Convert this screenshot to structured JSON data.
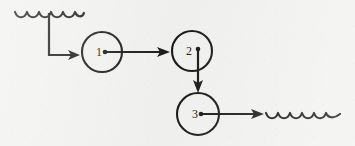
{
  "figure": {
    "type": "flow-diagram",
    "style": "hand-drawn scanned line art",
    "background_color": "#f2f2f0",
    "ink_color": "#1a1a1a",
    "width": 355,
    "height": 146
  },
  "nodes": [
    {
      "id": "node-1",
      "label": "1",
      "cx": 102,
      "cy": 52,
      "r": 20
    },
    {
      "id": "node-2",
      "label": "2",
      "cx": 192,
      "cy": 51,
      "r": 20
    },
    {
      "id": "node-3",
      "label": "3",
      "cx": 198,
      "cy": 114,
      "r": 21
    }
  ],
  "edges": [
    {
      "id": "edge-input-to-1",
      "from": "input-squiggle",
      "to": "node-1",
      "shape": "elbow-down-right",
      "arrow": true
    },
    {
      "id": "edge-1-to-2",
      "from": "node-1",
      "to": "node-2",
      "shape": "horizontal-right",
      "arrow": true
    },
    {
      "id": "edge-2-to-3",
      "from": "node-2",
      "to": "node-3",
      "shape": "vertical-down",
      "arrow": true
    },
    {
      "id": "edge-3-to-output",
      "from": "node-3",
      "to": "output-squiggle",
      "shape": "horizontal-right",
      "arrow": true
    }
  ],
  "squiggles": [
    {
      "id": "input-squiggle",
      "position": "top-left",
      "x_start": 15,
      "x_end": 84,
      "y": 13,
      "arcs": 5
    },
    {
      "id": "output-squiggle",
      "position": "bottom-right",
      "x_start": 266,
      "x_end": 340,
      "y": 114,
      "arcs": 6
    }
  ],
  "geometry": {
    "input_stem_x": 49,
    "input_stem_top_y": 13,
    "input_stem_bottom_y": 55,
    "input_arrow_tip_x": 80,
    "edge12_y": 52,
    "edge12_tip_x": 170,
    "edge23_x": 198,
    "edge23_tip_y": 93,
    "edge3out_y": 114,
    "edge3out_tip_x": 264
  }
}
